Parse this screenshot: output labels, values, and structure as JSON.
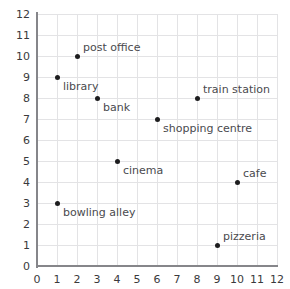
{
  "chart_data": {
    "type": "scatter",
    "title": "",
    "xlabel": "",
    "ylabel": "",
    "xlim": [
      0,
      12
    ],
    "ylim": [
      0,
      12
    ],
    "grid": true,
    "legend": "none",
    "x_ticks": [
      "0",
      "1",
      "2",
      "3",
      "4",
      "5",
      "6",
      "7",
      "8",
      "9",
      "10",
      "11",
      "12"
    ],
    "y_ticks": [
      "0",
      "1",
      "2",
      "3",
      "4",
      "5",
      "6",
      "7",
      "8",
      "9",
      "10",
      "11",
      "12"
    ],
    "points": [
      {
        "label": "library",
        "x": 1,
        "y": 9,
        "label_pos": "below-right"
      },
      {
        "label": "post office",
        "x": 2,
        "y": 10,
        "label_pos": "above-right"
      },
      {
        "label": "bank",
        "x": 3,
        "y": 8,
        "label_pos": "below-right"
      },
      {
        "label": "train station",
        "x": 8,
        "y": 8,
        "label_pos": "above-right"
      },
      {
        "label": "shopping centre",
        "x": 6,
        "y": 7,
        "label_pos": "below-right"
      },
      {
        "label": "cinema",
        "x": 4,
        "y": 5,
        "label_pos": "below-right"
      },
      {
        "label": "cafe",
        "x": 10,
        "y": 4,
        "label_pos": "above-right"
      },
      {
        "label": "bowling alley",
        "x": 1,
        "y": 3,
        "label_pos": "below-right"
      },
      {
        "label": "pizzeria",
        "x": 9,
        "y": 1,
        "label_pos": "above-right"
      }
    ]
  },
  "style": {
    "grid_color": "#e3e3e5",
    "axis_color": "#86868a",
    "marker_color": "#1d1d1f",
    "tick_text_color": "#3a3a3c",
    "label_text_color": "#4a4a4e",
    "background": "#ffffff"
  }
}
